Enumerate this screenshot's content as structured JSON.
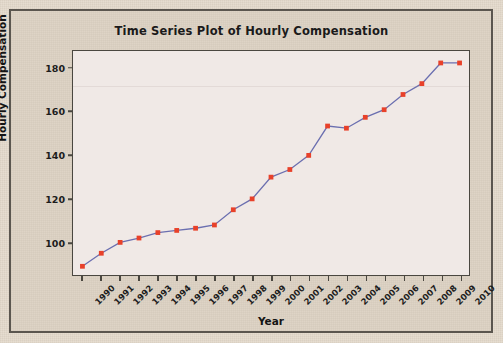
{
  "chart_data": {
    "type": "line",
    "title": "Time Series Plot of Hourly Compensation",
    "xlabel": "Year",
    "ylabel": "Hourly Compensation",
    "categories": [
      "1990",
      "1991",
      "1992",
      "1993",
      "1994",
      "1995",
      "1996",
      "1997",
      "1998",
      "1999",
      "2000",
      "2001",
      "2002",
      "2003",
      "2004",
      "2005",
      "2006",
      "2007",
      "2008",
      "2009",
      "2010"
    ],
    "values": [
      89,
      95,
      100,
      102,
      104.5,
      105.5,
      106.5,
      108,
      115,
      120,
      130,
      133.5,
      140,
      153.5,
      152.5,
      157.5,
      161,
      168,
      173,
      182.5,
      182.5
    ],
    "series": [
      {
        "name": "Hourly Compensation",
        "values": [
          89,
          95,
          100,
          102,
          104.5,
          105.5,
          106.5,
          108,
          115,
          120,
          130,
          133.5,
          140,
          153.5,
          152.5,
          157.5,
          161,
          168,
          173,
          182.5,
          182.5
        ],
        "line_color": "#6b6fb0",
        "marker_color": "#e8412a",
        "marker_shape": "square"
      }
    ],
    "yticks": [
      100,
      120,
      140,
      160,
      180
    ],
    "ylim": [
      85,
      188
    ],
    "grid": false,
    "legend": "none",
    "xtick_rotation": -45
  },
  "figure": {
    "background_color": "#ded4c6",
    "plot_background_color": "#f0e9e6",
    "frame_color": "#5b564f",
    "axis_color": "#4a4740"
  }
}
